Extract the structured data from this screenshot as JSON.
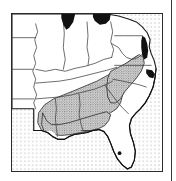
{
  "figure": {
    "kind": "distribution-map",
    "region_label": "Southeastern United States",
    "frame": {
      "border_color": "#2b2b2b",
      "background_color": "#ffffff",
      "x": 11,
      "y": 13,
      "width": 152,
      "height": 159
    }
  },
  "colors": {
    "land_fill": "#ffffff",
    "outline": "#1a1a1a",
    "state_border": "#3b3b3b",
    "water_black": "#111111",
    "ocean_stipple_dot": "#8a8a8a",
    "range_stipple_dot": "#6f6f6f",
    "range_tint": "#d9d9d9",
    "column_rule": "#3a3a3a"
  },
  "legend_items": [
    {
      "id": "species-range",
      "label": "Species range",
      "pattern": "dense-stipple"
    },
    {
      "id": "ocean",
      "label": "Ocean / water body",
      "pattern": "sparse-dot-grid"
    },
    {
      "id": "great-lakes",
      "label": "Great Lakes",
      "pattern": "solid-black"
    },
    {
      "id": "locality-record",
      "label": "Locality record",
      "pattern": "solid-dot"
    }
  ],
  "water_bodies": [
    {
      "id": "lake-michigan",
      "name": "Lake Michigan",
      "fill": "solid-black"
    },
    {
      "id": "lake-erie",
      "name": "Lake Erie",
      "fill": "solid-black"
    },
    {
      "id": "chesapeake-bay",
      "name": "Chesapeake Bay",
      "fill": "solid-black"
    },
    {
      "id": "pamlico-sound",
      "name": "Pamlico Sound",
      "fill": "solid-black"
    },
    {
      "id": "atlantic-ocean",
      "name": "Atlantic Ocean",
      "fill": "sparse-dot-grid"
    },
    {
      "id": "gulf-of-mexico",
      "name": "Gulf of Mexico",
      "fill": "sparse-dot-grid"
    }
  ],
  "locality_points": [
    {
      "id": "south-florida-record",
      "label": "South Florida record",
      "x": 120,
      "y": 154
    }
  ],
  "ocean_stipple": {
    "spacing": 4,
    "dot_radius": 0.55
  },
  "range_stipple": {
    "spacing": 2.4,
    "dot_radius": 0.55
  },
  "counts": {
    "locality_points": 1,
    "black_water_bodies": 4
  }
}
